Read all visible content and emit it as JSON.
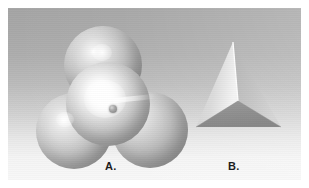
{
  "figure": {
    "panel": {
      "background_top_color": "#a5a5a5",
      "background_bottom_color": "#f8f8f8",
      "border_color": "#ffffff"
    },
    "items": [
      {
        "id": "space-filling-model",
        "label": "A.",
        "description": "space-filling sphere model",
        "sphere_count": 4,
        "spheres": [
          {
            "name": "top-sphere",
            "cx": 95,
            "cy": 57,
            "r": 39,
            "highlight_color": "#ffffff"
          },
          {
            "name": "left-sphere",
            "cx": 66,
            "cy": 123,
            "r": 38,
            "highlight_color": "#ffffff"
          },
          {
            "name": "right-sphere",
            "cx": 142,
            "cy": 122,
            "r": 38,
            "highlight_color": "#f8f8f8"
          },
          {
            "name": "front-sphere",
            "cx": 100,
            "cy": 96,
            "r": 42,
            "highlight_color": "#ffffff"
          }
        ],
        "center_atom": {
          "cx": 105,
          "cy": 101,
          "r": 4,
          "color": "#7d7d7d"
        }
      },
      {
        "id": "tetrahedron-model",
        "label": "B.",
        "description": "tetrahedron wireframe-solid model",
        "apex": {
          "x": 233,
          "y": 42
        },
        "faces": [
          {
            "name": "left-face",
            "color": "#d9d9d9",
            "points": "196,127 233,42 238,101"
          },
          {
            "name": "right-face",
            "color": "#bfbfbf",
            "points": "233,42 281,127 238,101"
          },
          {
            "name": "front-face",
            "color": "#909090",
            "points": "196,127 238,101 281,127"
          }
        ],
        "edges": [
          {
            "name": "apex-to-center-edge",
            "color": "#fdfdfd"
          },
          {
            "name": "left-base-edge",
            "color": "#8a8a8a"
          },
          {
            "name": "right-base-edge",
            "color": "#8a8a8a"
          }
        ]
      }
    ]
  }
}
